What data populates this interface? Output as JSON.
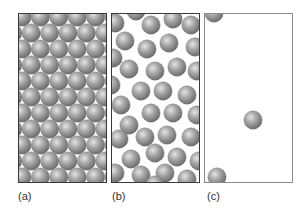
{
  "figure": {
    "panels": [
      {
        "id": "a",
        "label": "(a)",
        "state": "solid",
        "arrangement": "hexagonal close-packed lattice"
      },
      {
        "id": "b",
        "label": "(b)",
        "state": "liquid",
        "arrangement": "disordered, closely packed"
      },
      {
        "id": "c",
        "label": "(c)",
        "state": "gas",
        "arrangement": "sparse, widely separated",
        "particle_count_visible": 3
      }
    ],
    "particle_color": "#9a9a9a",
    "particle_highlight": "#e0e0e0",
    "particle_shadow": "#6a6a6a",
    "frame_color": "#3a3a3a"
  }
}
